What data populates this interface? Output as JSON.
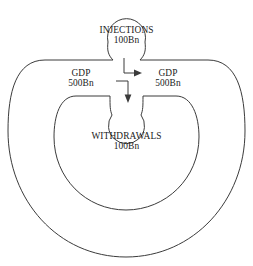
{
  "diagram": {
    "type": "circular-flow-diagram",
    "stroke_color": "#3b3b3b",
    "background_color": "#ffffff",
    "nodes": {
      "injections": {
        "label": "INJECTIONS",
        "value": "100Bn",
        "shape": "circle",
        "position": "top-center"
      },
      "withdrawals": {
        "label": "WITHDRAWALS",
        "value": "100Bn",
        "shape": "circle",
        "position": "center"
      }
    },
    "flows": [
      {
        "id": "gdp-left",
        "label": "GDP",
        "value": "500Bn",
        "position": "left-of-center"
      },
      {
        "id": "gdp-right",
        "label": "GDP",
        "value": "500Bn",
        "position": "right-of-center"
      }
    ],
    "arrows": [
      {
        "id": "injection-arrow",
        "direction": "right",
        "meaning": "injections enter the flow"
      },
      {
        "id": "withdrawal-arrow",
        "direction": "down",
        "meaning": "withdrawals leave the flow"
      }
    ]
  }
}
